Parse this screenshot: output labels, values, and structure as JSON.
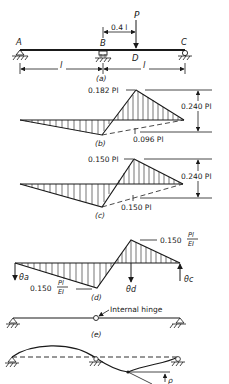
{
  "figure": {
    "a": {
      "caption": "(a)",
      "labels": {
        "A": "A",
        "B": "B",
        "C": "C",
        "D": "D",
        "P": "P"
      },
      "load_offset": "0.4 l",
      "span_left": "l",
      "span_right": "l"
    },
    "b": {
      "caption": "(b)",
      "peak_label": "0.182 Pl",
      "dim_label": "0.240 Pl",
      "mid_label": "0.096 Pl"
    },
    "c": {
      "caption": "(c)",
      "peak_label": "0.150 Pl",
      "dim_label": "0.240 Pl",
      "mid_label": "0.150 Pl"
    },
    "d": {
      "caption": "(d)",
      "peak_coef": "0.150",
      "bottom_coef": "0.150",
      "frac_num": "Pl",
      "frac_den": "EI",
      "theta_a": "θa",
      "theta_d": "θd",
      "theta_c": "θc"
    },
    "e": {
      "caption": "(e)",
      "hinge_label": "Internal hinge"
    },
    "f": {
      "rho_label": "ρ"
    }
  }
}
